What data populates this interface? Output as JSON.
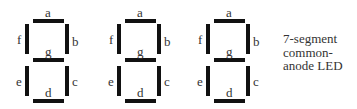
{
  "diagram": {
    "caption_lines": [
      "7-segment",
      "common-",
      "anode LED"
    ],
    "segment_color": "#111111",
    "label_color": "#333333",
    "digits": [
      {
        "index": 1,
        "segments": {
          "a": "a",
          "b": "b",
          "c": "c",
          "d": "d",
          "e": "e",
          "f": "f",
          "g": "g"
        }
      },
      {
        "index": 2,
        "segments": {
          "a": "a",
          "b": "b",
          "c": "c",
          "d": "d",
          "e": "e",
          "f": "f",
          "g": "g"
        }
      },
      {
        "index": 3,
        "segments": {
          "a": "a",
          "b": "b",
          "c": "c",
          "d": "d",
          "e": "e",
          "f": "f",
          "g": "g"
        }
      }
    ]
  }
}
